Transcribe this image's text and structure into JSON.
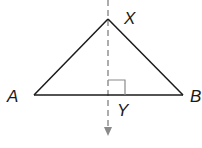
{
  "diagram": {
    "type": "geometry",
    "points": {
      "X": {
        "label": "X",
        "x": 108,
        "y": 19
      },
      "A": {
        "label": "A",
        "x": 34,
        "y": 95
      },
      "B": {
        "label": "B",
        "x": 183,
        "y": 95
      },
      "Y": {
        "label": "Y",
        "x": 108,
        "y": 95
      }
    },
    "labels": {
      "X": "X",
      "A": "A",
      "B": "B",
      "Y": "Y"
    },
    "annotations": {
      "right_angle_at": "Y",
      "perpendicular_line": "dashed, arrow pointing down"
    },
    "colors": {
      "line": "#1a1a1a",
      "dashed": "#8a8a8a"
    }
  }
}
